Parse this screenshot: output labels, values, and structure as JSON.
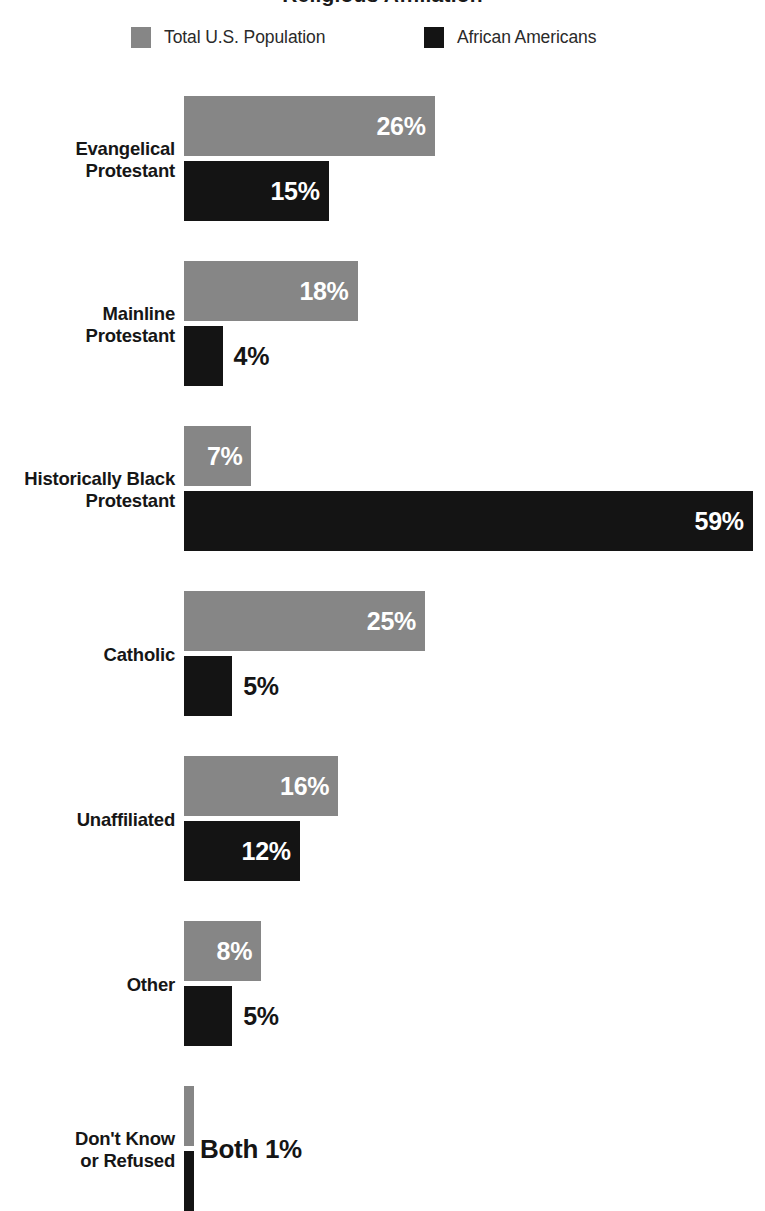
{
  "title": "Religious Affiliation",
  "legend": {
    "position": "top",
    "items": [
      {
        "label": "Total U.S. Population",
        "color": "#868686",
        "swatch_name": "legend-swatch-total"
      },
      {
        "label": "African Americans",
        "color": "#141414",
        "swatch_name": "legend-swatch-african"
      }
    ]
  },
  "chart_data": {
    "type": "bar",
    "orientation": "horizontal",
    "title": "Religious Affiliation",
    "xlabel": "",
    "ylabel": "",
    "xlim": [
      0,
      59
    ],
    "grid": false,
    "legend_position": "top",
    "value_suffix": "%",
    "categories": [
      "Evangelical Protestant",
      "Mainline Protestant",
      "Historically Black Protestant",
      "Catholic",
      "Unaffiliated",
      "Other",
      "Don't Know or Refused"
    ],
    "series": [
      {
        "name": "Total U.S. Population",
        "color": "#868686",
        "values": [
          26,
          18,
          7,
          25,
          16,
          8,
          1
        ]
      },
      {
        "name": "African Americans",
        "color": "#141414",
        "values": [
          15,
          4,
          59,
          5,
          12,
          5,
          1
        ]
      }
    ]
  },
  "groups": [
    {
      "label_line1": "Evangelical",
      "label_line2": "Protestant",
      "bars": [
        {
          "series": "Total U.S. Population",
          "value": 26,
          "label": "26%",
          "label_placement": "inside"
        },
        {
          "series": "African Americans",
          "value": 15,
          "label": "15%",
          "label_placement": "inside"
        }
      ],
      "combined_label": ""
    },
    {
      "label_line1": "Mainline",
      "label_line2": "Protestant",
      "bars": [
        {
          "series": "Total U.S. Population",
          "value": 18,
          "label": "18%",
          "label_placement": "inside"
        },
        {
          "series": "African Americans",
          "value": 4,
          "label": "4%",
          "label_placement": "outside"
        }
      ],
      "combined_label": ""
    },
    {
      "label_line1": "Historically Black",
      "label_line2": "Protestant",
      "bars": [
        {
          "series": "Total U.S. Population",
          "value": 7,
          "label": "7%",
          "label_placement": "inside"
        },
        {
          "series": "African Americans",
          "value": 59,
          "label": "59%",
          "label_placement": "inside"
        }
      ],
      "combined_label": ""
    },
    {
      "label_line1": "Catholic",
      "label_line2": "",
      "bars": [
        {
          "series": "Total U.S. Population",
          "value": 25,
          "label": "25%",
          "label_placement": "inside"
        },
        {
          "series": "African Americans",
          "value": 5,
          "label": "5%",
          "label_placement": "outside"
        }
      ],
      "combined_label": ""
    },
    {
      "label_line1": "Unaffiliated",
      "label_line2": "",
      "bars": [
        {
          "series": "Total U.S. Population",
          "value": 16,
          "label": "16%",
          "label_placement": "inside"
        },
        {
          "series": "African Americans",
          "value": 12,
          "label": "12%",
          "label_placement": "inside"
        }
      ],
      "combined_label": ""
    },
    {
      "label_line1": "Other",
      "label_line2": "",
      "bars": [
        {
          "series": "Total U.S. Population",
          "value": 8,
          "label": "8%",
          "label_placement": "inside"
        },
        {
          "series": "African Americans",
          "value": 5,
          "label": "5%",
          "label_placement": "outside"
        }
      ],
      "combined_label": ""
    },
    {
      "label_line1": "Don't Know",
      "label_line2": "or Refused",
      "bars": [
        {
          "series": "Total U.S. Population",
          "value": 1,
          "label": "",
          "label_placement": "none"
        },
        {
          "series": "African Americans",
          "value": 1,
          "label": "",
          "label_placement": "none"
        }
      ],
      "combined_label": "Both 1%"
    }
  ],
  "layout": {
    "bar_origin_x": 184,
    "px_per_percent": 9.64,
    "bar_height": 60,
    "bar_gap": 5,
    "group_gap": 40,
    "first_group_top": 96,
    "min_bar_width": 8
  }
}
